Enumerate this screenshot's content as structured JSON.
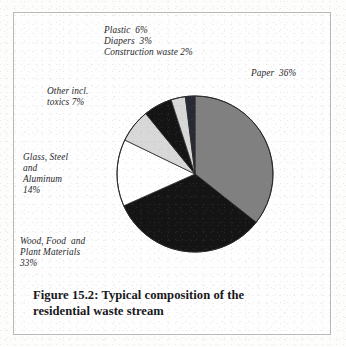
{
  "figure": {
    "caption_line1": "Figure 15.2: Typical composition of the",
    "caption_line2": "residential waste stream",
    "border_color": "#b9b9b9",
    "background": "#fefefe"
  },
  "labels": {
    "plastic": "Plastic  6%",
    "diapers": "Diapers  3%",
    "construction": "Construction waste 2%",
    "paper": "Paper  36%",
    "other_line1": "Other incl.",
    "other_line2": "toxics 7%",
    "glass_line1": "Glass, Steel",
    "glass_line2": "and",
    "glass_line3": "Aluminum",
    "glass_line4": "14%",
    "wood_line1": "Wood, Food  and",
    "wood_line2": "Plant Materials",
    "wood_line3": "33%"
  },
  "chart_data": {
    "type": "pie",
    "title": "Figure 15.2: Typical composition of the residential waste stream",
    "units": "percent",
    "start_angle_deg": 0,
    "direction": "clockwise",
    "total": 101,
    "categories": [
      "Paper",
      "Wood, Food and Plant Materials",
      "Glass, Steel and Aluminum",
      "Other incl. toxics",
      "Plastic",
      "Diapers",
      "Construction waste"
    ],
    "values": [
      36,
      33,
      14,
      7,
      6,
      3,
      2
    ],
    "slices": [
      {
        "name": "Paper",
        "value": 36,
        "color": "#808080",
        "label": "Paper  36%"
      },
      {
        "name": "Wood, Food and Plant Materials",
        "value": 33,
        "color": "#141414",
        "label": "Wood, Food  and Plant Materials 33%"
      },
      {
        "name": "Glass, Steel and Aluminum",
        "value": 14,
        "color": "#ffffff",
        "label": "Glass, Steel and Aluminum 14%"
      },
      {
        "name": "Other incl. toxics",
        "value": 7,
        "color": "#d8d8d8",
        "label": "Other incl. toxics 7%"
      },
      {
        "name": "Plastic",
        "value": 6,
        "color": "#141414",
        "label": "Plastic  6%"
      },
      {
        "name": "Diapers",
        "value": 3,
        "color": "#d8d8d8",
        "label": "Diapers  3%"
      },
      {
        "name": "Construction waste",
        "value": 2,
        "color": "#262a33",
        "label": "Construction waste 2%"
      }
    ],
    "legend": "none",
    "grid": false
  }
}
